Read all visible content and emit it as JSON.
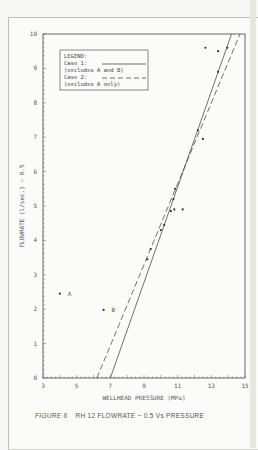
{
  "figure": {
    "caption_label": "FIGURE 6",
    "caption_text": "RH 12  FLOWRATE ~ 0.5  Vs  PRESSURE"
  },
  "legend": {
    "title": "LEGEND:",
    "entries": [
      {
        "label": "Case 1:",
        "note": "(excludes A and B)",
        "style": "solid"
      },
      {
        "label": "Case 2:",
        "note": "(excludes A only)",
        "style": "dashed"
      }
    ]
  },
  "chart_data": {
    "type": "scatter",
    "title": "RH 12 FLOWRATE ~ 0.5 Vs PRESSURE",
    "xlabel": "WELLHEAD PRESSURE (MPa)",
    "ylabel": "FLOWRATE (l/sec.) ~ 0.5",
    "xlim": [
      3,
      15
    ],
    "ylim": [
      0,
      10
    ],
    "xticks": [
      3,
      5,
      7,
      9,
      11,
      13,
      15
    ],
    "yticks": [
      0,
      1,
      2,
      3,
      4,
      5,
      6,
      7,
      8,
      9,
      10
    ],
    "grid": false,
    "legend_position": "upper-left",
    "series": [
      {
        "name": "Measured points",
        "type": "scatter",
        "points": [
          {
            "x": 4.0,
            "y": 2.45,
            "label": "A"
          },
          {
            "x": 6.6,
            "y": 1.98,
            "label": "B"
          },
          {
            "x": 9.2,
            "y": 3.45
          },
          {
            "x": 9.4,
            "y": 3.75
          },
          {
            "x": 10.0,
            "y": 4.3
          },
          {
            "x": 10.2,
            "y": 4.45
          },
          {
            "x": 10.6,
            "y": 4.85
          },
          {
            "x": 10.8,
            "y": 4.9
          },
          {
            "x": 11.3,
            "y": 4.9
          },
          {
            "x": 10.75,
            "y": 5.2
          },
          {
            "x": 10.85,
            "y": 5.5
          },
          {
            "x": 12.2,
            "y": 7.2
          },
          {
            "x": 12.5,
            "y": 6.95
          },
          {
            "x": 12.65,
            "y": 9.6
          },
          {
            "x": 13.4,
            "y": 9.5
          },
          {
            "x": 13.95,
            "y": 9.6
          },
          {
            "x": 13.4,
            "y": 8.9
          }
        ]
      },
      {
        "name": "Case 1 (excludes A and B)",
        "type": "line",
        "style": "solid",
        "points": [
          {
            "x": 7.0,
            "y": 0
          },
          {
            "x": 14.2,
            "y": 10
          }
        ]
      },
      {
        "name": "Case 2 (excludes A only)",
        "type": "line",
        "style": "dashed",
        "points": [
          {
            "x": 6.2,
            "y": 0
          },
          {
            "x": 14.7,
            "y": 10
          }
        ]
      }
    ]
  }
}
